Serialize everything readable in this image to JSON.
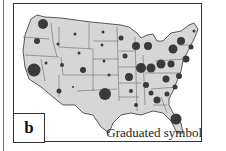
{
  "panel_label": "b",
  "caption": "Graduated symbol",
  "colors": {
    "land": "#d6d6d6",
    "border": "#333333",
    "symbol": "#3a3a3a",
    "background": "#ffffff"
  },
  "map": {
    "type": "graduated-symbol",
    "region": "contiguous United States",
    "symbols": [
      {
        "x": 42,
        "y": 23,
        "r": 5
      },
      {
        "x": 36,
        "y": 40,
        "r": 3
      },
      {
        "x": 57,
        "y": 43,
        "r": 1.5
      },
      {
        "x": 74,
        "y": 33,
        "r": 1.5
      },
      {
        "x": 78,
        "y": 52,
        "r": 1.5
      },
      {
        "x": 33,
        "y": 69,
        "r": 6.5
      },
      {
        "x": 45,
        "y": 62,
        "r": 1.5
      },
      {
        "x": 61,
        "y": 64,
        "r": 2
      },
      {
        "x": 82,
        "y": 69,
        "r": 3
      },
      {
        "x": 72,
        "y": 86,
        "r": 1
      },
      {
        "x": 58,
        "y": 90,
        "r": 2.5
      },
      {
        "x": 102,
        "y": 31,
        "r": 1.5
      },
      {
        "x": 101,
        "y": 44,
        "r": 1.5
      },
      {
        "x": 103,
        "y": 60,
        "r": 1.5
      },
      {
        "x": 108,
        "y": 74,
        "r": 1.5
      },
      {
        "x": 104,
        "y": 93,
        "r": 6
      },
      {
        "x": 120,
        "y": 37,
        "r": 2.5
      },
      {
        "x": 124,
        "y": 55,
        "r": 2.5
      },
      {
        "x": 128,
        "y": 76,
        "r": 4
      },
      {
        "x": 130,
        "y": 90,
        "r": 2
      },
      {
        "x": 135,
        "y": 104,
        "r": 2
      },
      {
        "x": 135,
        "y": 45,
        "r": 4
      },
      {
        "x": 147,
        "y": 45,
        "r": 4
      },
      {
        "x": 140,
        "y": 67,
        "r": 5
      },
      {
        "x": 150,
        "y": 67,
        "r": 4.5
      },
      {
        "x": 145,
        "y": 84,
        "r": 3
      },
      {
        "x": 150,
        "y": 92,
        "r": 2.5
      },
      {
        "x": 156,
        "y": 99,
        "r": 3.5
      },
      {
        "x": 160,
        "y": 63,
        "r": 4.5
      },
      {
        "x": 165,
        "y": 78,
        "r": 3.5
      },
      {
        "x": 170,
        "y": 63,
        "r": 3.5
      },
      {
        "x": 172,
        "y": 48,
        "r": 4.5
      },
      {
        "x": 180,
        "y": 40,
        "r": 4
      },
      {
        "x": 185,
        "y": 58,
        "r": 3.5
      },
      {
        "x": 178,
        "y": 75,
        "r": 3
      },
      {
        "x": 174,
        "y": 86,
        "r": 2.5
      },
      {
        "x": 166,
        "y": 93,
        "r": 2.5
      },
      {
        "x": 175,
        "y": 118,
        "r": 5.5
      },
      {
        "x": 193,
        "y": 30,
        "r": 1.5
      },
      {
        "x": 190,
        "y": 46,
        "r": 2.5
      }
    ]
  }
}
